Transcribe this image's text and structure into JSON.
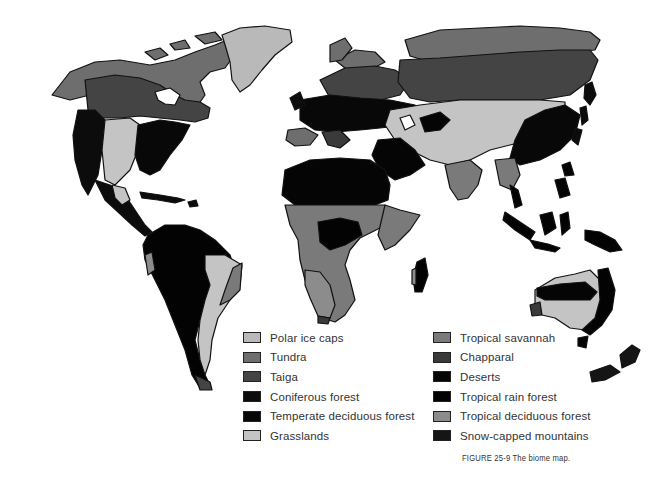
{
  "figure": {
    "caption": "FIGURE 25-9 The biome map."
  },
  "legend": {
    "left": [
      {
        "label": "Polar ice caps",
        "color": "#b9b9b9"
      },
      {
        "label": "Tundra",
        "color": "#6e6e6e"
      },
      {
        "label": "Taiga",
        "color": "#444444"
      },
      {
        "label": "Coniferous forest",
        "color": "#0c0c0c"
      },
      {
        "label": "Temperate deciduous forest",
        "color": "#080808"
      },
      {
        "label": "Grasslands",
        "color": "#c4c4c4"
      }
    ],
    "right": [
      {
        "label": "Tropical savannah",
        "color": "#7a7a7a"
      },
      {
        "label": "Chapparal",
        "color": "#3a3a3a"
      },
      {
        "label": "Deserts",
        "color": "#050505"
      },
      {
        "label": "Tropical rain forest",
        "color": "#030303"
      },
      {
        "label": "Tropical deciduous forest",
        "color": "#8c8c8c"
      },
      {
        "label": "Snow-capped mountains",
        "color": "#151515"
      }
    ]
  },
  "map": {
    "regions": [
      "North America",
      "Greenland",
      "South America",
      "Europe",
      "Asia",
      "Africa",
      "Madagascar",
      "Australia",
      "New Zealand",
      "Southeast Asia islands"
    ]
  }
}
